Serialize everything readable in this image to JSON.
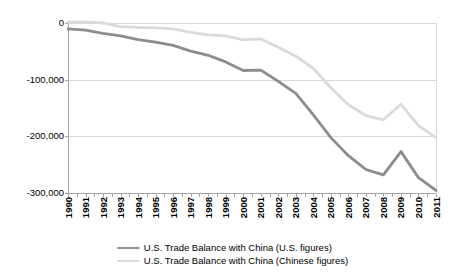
{
  "chart_data": {
    "type": "line",
    "title": "",
    "x": [
      1990,
      1991,
      1992,
      1993,
      1994,
      1995,
      1996,
      1997,
      1998,
      1999,
      2000,
      2001,
      2002,
      2003,
      2004,
      2005,
      2006,
      2007,
      2008,
      2009,
      2010,
      2011
    ],
    "series": [
      {
        "name": "U.S. Trade Balance with China (U.S. figures)",
        "color": "#8c8c8c",
        "values": [
          -10431,
          -12691,
          -18309,
          -22777,
          -29505,
          -33790,
          -39520,
          -49696,
          -56927,
          -68677,
          -83833,
          -83096,
          -103065,
          -124068,
          -162254,
          -202278,
          -234101,
          -258506,
          -268040,
          -226877,
          -273042,
          -295456
        ]
      },
      {
        "name": "U.S. Trade Balance with China (Chinese figures)",
        "color": "#dadada",
        "values": [
          1400,
          1800,
          300,
          -6300,
          -7500,
          -8600,
          -10500,
          -16400,
          -21000,
          -22500,
          -29700,
          -28100,
          -42700,
          -58600,
          -80300,
          -114200,
          -144300,
          -163300,
          -170900,
          -143400,
          -181300,
          -202300
        ]
      }
    ],
    "ylim": [
      -300000,
      0
    ],
    "yticks": [
      0,
      -100000,
      -200000,
      -300000
    ],
    "ytick_labels": [
      "0",
      "-100,000",
      "-200,000",
      "-300,000"
    ],
    "xlabel": "",
    "ylabel": "",
    "grid": "horizontal",
    "legend_position": "bottom-center"
  },
  "colors": {
    "background": "#ffffff",
    "gridline": "#d9d9d9",
    "axis": "#a6a6a6",
    "text": "#000000"
  }
}
